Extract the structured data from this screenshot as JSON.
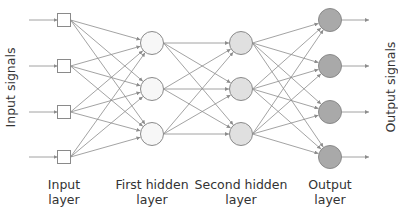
{
  "side_labels": {
    "left": "Input signals",
    "right": "Output signals"
  },
  "layers": [
    {
      "id": "input",
      "label_line1": "Input",
      "label_line2": "layer",
      "shape": "square",
      "x": 64,
      "nodes_y": [
        20,
        66,
        112,
        157
      ],
      "fill": "#ffffff"
    },
    {
      "id": "hidden1",
      "label_line1": "First hidden",
      "label_line2": "layer",
      "shape": "circle",
      "x": 152,
      "nodes_y": [
        43,
        89,
        134
      ],
      "fill": "#f7f7f7"
    },
    {
      "id": "hidden2",
      "label_line1": "Second hidden",
      "label_line2": "layer",
      "shape": "circle",
      "x": 241,
      "nodes_y": [
        43,
        89,
        134
      ],
      "fill": "#e0e0e0"
    },
    {
      "id": "output",
      "label_line1": "Output",
      "label_line2": "layer",
      "shape": "circle",
      "x": 330,
      "nodes_y": [
        20,
        66,
        112,
        157
      ],
      "fill": "#a9a9a9"
    }
  ],
  "colors": {
    "edge": "#8c8c8c",
    "node_stroke": "#8a8a8a",
    "text": "#333333"
  }
}
